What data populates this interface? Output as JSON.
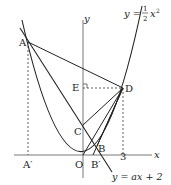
{
  "diagram": {
    "type": "coordinate-geometry",
    "axes": {
      "x_label": "x",
      "y_label": "y",
      "origin_label": "O"
    },
    "curves": {
      "parabola": {
        "label_prefix": "y = ",
        "num": "1",
        "den": "2",
        "var": "x",
        "exp": "2"
      },
      "line": {
        "label": "y = ax + 2"
      }
    },
    "points": {
      "A": "A",
      "A_prime": "A′",
      "B": "B",
      "B_prime": "B′",
      "C": "C",
      "D": "D",
      "E": "E",
      "O": "O"
    },
    "tick_labels": {
      "x3": "3"
    },
    "colors": {
      "stroke": "#222222",
      "background": "#ffffff"
    }
  }
}
